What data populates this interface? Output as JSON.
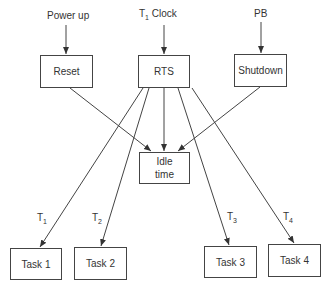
{
  "inputs": {
    "power_up": "Power up",
    "clock_prefix": "T",
    "clock_sub": "1",
    "clock_suffix": " Clock",
    "pb": "PB"
  },
  "boxes": {
    "reset": "Reset",
    "rts": "RTS",
    "shutdown": "Shutdown",
    "idle_line1": "Idle",
    "idle_line2": "time",
    "task1": "Task 1",
    "task2": "Task 2",
    "task3": "Task 3",
    "task4": "Task 4"
  },
  "edge_labels": [
    {
      "main": "T",
      "sub": "1"
    },
    {
      "main": "T",
      "sub": "2"
    },
    {
      "main": "T",
      "sub": "3"
    },
    {
      "main": "T",
      "sub": "4"
    }
  ]
}
